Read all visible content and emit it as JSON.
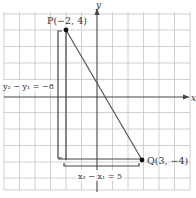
{
  "figure": {
    "axes": {
      "x_label": "x",
      "y_label": "y"
    },
    "points": {
      "P": {
        "label": "P(−2, 4)",
        "x": -2,
        "y": 4
      },
      "Q": {
        "label": "Q(3, −4)",
        "x": 3,
        "y": -4
      }
    },
    "annotations": {
      "vertical_change": "y₂ − y₁ = −8",
      "horizontal_change": "x₂ − x₁ = 5"
    },
    "colors": {
      "grid": "#bdbdbd",
      "axis": "#444444",
      "line": "#555555",
      "point": "#111111",
      "text": "#333333"
    }
  }
}
